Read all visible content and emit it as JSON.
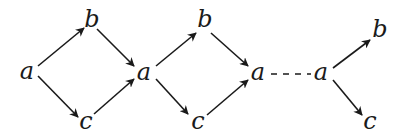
{
  "diagram": {
    "colors": {
      "stroke": "#1a1a1a",
      "background": "#ffffff"
    },
    "nodes": [
      {
        "id": "a1",
        "label": "a",
        "x": 27,
        "y": 72
      },
      {
        "id": "b1",
        "label": "b",
        "x": 92,
        "y": 20
      },
      {
        "id": "c1",
        "label": "c",
        "x": 86,
        "y": 122
      },
      {
        "id": "a2",
        "label": "a",
        "x": 144,
        "y": 73
      },
      {
        "id": "b2",
        "label": "b",
        "x": 205,
        "y": 20
      },
      {
        "id": "c2",
        "label": "c",
        "x": 198,
        "y": 122
      },
      {
        "id": "a3",
        "label": "a",
        "x": 258,
        "y": 73
      },
      {
        "id": "a4",
        "label": "a",
        "x": 321,
        "y": 73
      },
      {
        "id": "b3",
        "label": "b",
        "x": 380,
        "y": 30
      },
      {
        "id": "c3",
        "label": "c",
        "x": 370,
        "y": 122
      }
    ],
    "edges": [
      {
        "from": "a1",
        "to": "b1",
        "style": "arrow",
        "x1": 38,
        "y1": 66,
        "x2": 84,
        "y2": 28
      },
      {
        "from": "a1",
        "to": "c1",
        "style": "arrow",
        "x1": 38,
        "y1": 76,
        "x2": 78,
        "y2": 117
      },
      {
        "from": "b1",
        "to": "a2",
        "style": "arrow",
        "x1": 97,
        "y1": 29,
        "x2": 134,
        "y2": 66
      },
      {
        "from": "c1",
        "to": "a2",
        "style": "arrow",
        "x1": 94,
        "y1": 114,
        "x2": 134,
        "y2": 79
      },
      {
        "from": "a2",
        "to": "b2",
        "style": "arrow",
        "x1": 156,
        "y1": 66,
        "x2": 196,
        "y2": 33
      },
      {
        "from": "a2",
        "to": "c2",
        "style": "arrow",
        "x1": 156,
        "y1": 79,
        "x2": 188,
        "y2": 114
      },
      {
        "from": "b2",
        "to": "a3",
        "style": "arrow",
        "x1": 211,
        "y1": 33,
        "x2": 248,
        "y2": 66
      },
      {
        "from": "c2",
        "to": "a3",
        "style": "arrow",
        "x1": 207,
        "y1": 115,
        "x2": 248,
        "y2": 80
      },
      {
        "from": "a3",
        "to": "a4",
        "style": "dashed",
        "x1": 271,
        "y1": 74,
        "x2": 311,
        "y2": 74
      },
      {
        "from": "a4",
        "to": "b3",
        "style": "arrow",
        "x1": 333,
        "y1": 68,
        "x2": 370,
        "y2": 40
      },
      {
        "from": "a4",
        "to": "c3",
        "style": "arrow",
        "x1": 333,
        "y1": 80,
        "x2": 362,
        "y2": 115
      }
    ]
  }
}
